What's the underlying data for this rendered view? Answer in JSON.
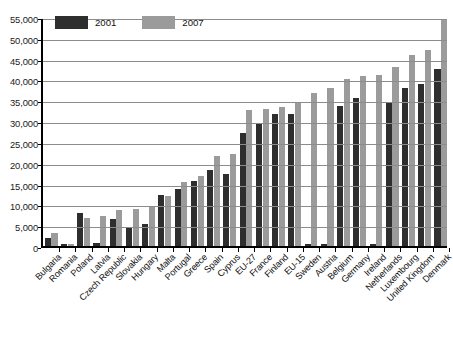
{
  "chart_data": {
    "type": "bar",
    "title": "",
    "subtitle": "",
    "xlabel": "",
    "ylabel": "",
    "ylim": [
      0,
      55000
    ],
    "ytick_step": 5000,
    "yticks": [
      "0",
      "5,000",
      "10,000",
      "15,000",
      "20,000",
      "25,000",
      "30,000",
      "35,000",
      "40,000",
      "45,000",
      "50,000",
      "55,000"
    ],
    "grid": true,
    "legend_position": "top-left",
    "colors": {
      "series_2001": "#2e2e2e",
      "series_2007": "#9b9b9b",
      "gridline": "#8c8c8c",
      "axis": "#000000",
      "text": "#111111",
      "background": "#ffffff"
    },
    "categories": [
      "Bulgaria",
      "Romania",
      "Poland",
      "Latvia",
      "Czech Republic",
      "Slovakia",
      "Hungary",
      "Malta",
      "Portugal",
      "Greece",
      "Spain",
      "Cyprus",
      "EU-27",
      "France",
      "Finland",
      "EU-15",
      "Sweden",
      "Austria",
      "Belgium",
      "Germany",
      "Ireland",
      "Netherlands",
      "Luxembourg",
      "United Kingdom",
      "Denmark"
    ],
    "series": [
      {
        "name": "2001",
        "color": "#2e2e2e",
        "values": [
          2000,
          600,
          7900,
          700,
          6500,
          4400,
          5400,
          12300,
          13700,
          15500,
          18200,
          17200,
          27200,
          29500,
          31700,
          31700,
          400,
          400,
          33700,
          35500,
          400,
          34400,
          38000,
          39000,
          42500
        ]
      },
      {
        "name": "2007",
        "color": "#9b9b9b",
        "values": [
          3200,
          400,
          6700,
          7100,
          8600,
          8800,
          9400,
          11900,
          15400,
          16900,
          21600,
          22000,
          32700,
          33000,
          33500,
          34700,
          36800,
          38000,
          40000,
          40800,
          41000,
          43000,
          45900,
          47000,
          54200
        ]
      }
    ]
  },
  "legend": {
    "items": [
      {
        "label": "2001",
        "swatch": "dark-swatch"
      },
      {
        "label": "2007",
        "swatch": "gray-swatch"
      }
    ]
  }
}
